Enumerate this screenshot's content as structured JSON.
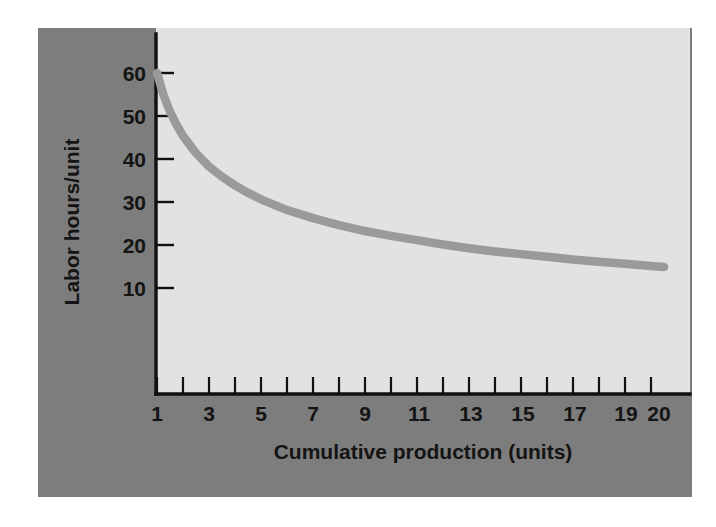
{
  "figure": {
    "panel_color": "#7d7d7d",
    "plot_background_color": "#e2e2e2",
    "page_background_color": "#ffffff"
  },
  "chart_data": {
    "type": "line",
    "title": "",
    "subtitle": "",
    "xlabel": "Cumulative production (units)",
    "ylabel": "Labor hours/unit",
    "xlim": [
      0.45,
      21.3
    ],
    "ylim": [
      0,
      66
    ],
    "grid": false,
    "legend": "none",
    "series_color": "#9a9a9a",
    "x_ticks_major": [
      1,
      3,
      5,
      7,
      9,
      11,
      13,
      15,
      17,
      19,
      20
    ],
    "x_tick_labels": [
      "1",
      "3",
      "5",
      "7",
      "9",
      "11",
      "13",
      "15",
      "17",
      "19",
      "20"
    ],
    "x_ticks_all": [
      1,
      2,
      3,
      4,
      5,
      6,
      7,
      8,
      9,
      10,
      11,
      12,
      13,
      14,
      15,
      16,
      17,
      18,
      19,
      20
    ],
    "y_ticks": [
      10,
      20,
      30,
      40,
      50,
      60
    ],
    "y_tick_labels": [
      "10",
      "20",
      "30",
      "40",
      "50",
      "60"
    ],
    "series": [
      {
        "name": "Learning curve",
        "x": [
          1,
          1.25,
          1.5,
          1.75,
          2,
          2.5,
          3,
          3.5,
          4,
          4.5,
          5,
          6,
          7,
          8,
          9,
          10,
          11,
          12,
          13,
          14,
          15,
          16,
          17,
          18,
          19,
          20,
          20.5
        ],
        "values": [
          60.0,
          55.9,
          52.8,
          50.4,
          48.3,
          45.1,
          42.6,
          40.7,
          39.1,
          37.7,
          36.5,
          34.5,
          33.0,
          31.7,
          30.6,
          29.7,
          28.9,
          28.1,
          27.4,
          26.8,
          26.3,
          25.8,
          25.3,
          24.9,
          24.5,
          24.1,
          23.9
        ]
      }
    ],
    "annotations": []
  },
  "labels": {
    "y_axis_title": "Labor hours/unit",
    "x_axis_title": "Cumulative production (units)"
  }
}
